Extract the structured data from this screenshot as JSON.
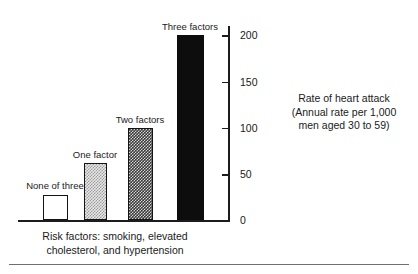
{
  "chart_data": {
    "type": "bar",
    "title": "",
    "categories": [
      "None of three",
      "One factor",
      "Two factors",
      "Three factors"
    ],
    "values": [
      28,
      62,
      100,
      200
    ],
    "series": [
      {
        "name": "Rate of heart attack",
        "values": [
          28,
          62,
          100,
          200
        ]
      }
    ],
    "bar_styles": [
      "open",
      "light-checker",
      "dark-checker",
      "solid-black"
    ],
    "xlabel": "Risk factors: smoking, elevated cholesterol, and hypertension",
    "ylabel": "Rate of heart attack (Annual rate per 1,000 men aged 30 to 59)",
    "ylim": [
      0,
      210
    ],
    "yticks": [
      0,
      50,
      100,
      150,
      200
    ],
    "ytick_labels": [
      "0",
      "50",
      "100",
      "150",
      "200"
    ],
    "y_axis_position": "right",
    "grid": false,
    "legend": "none"
  },
  "axis": {
    "ticks": [
      {
        "value": 200,
        "label": "200"
      },
      {
        "value": 150,
        "label": "150"
      },
      {
        "value": 100,
        "label": "100"
      },
      {
        "value": 50,
        "label": "50"
      },
      {
        "value": 0,
        "label": "0"
      }
    ]
  },
  "bars": [
    {
      "label": "None of three",
      "value": 28
    },
    {
      "label": "One factor",
      "value": 62
    },
    {
      "label": "Two factors",
      "value": 100
    },
    {
      "label": "Three factors",
      "value": 200
    }
  ],
  "axis_caption": {
    "line1": "Rate of heart attack",
    "line2": "(Annual rate per 1,000",
    "line3": "men aged 30 to 59)"
  },
  "x_caption": {
    "line1": "Risk factors: smoking, elevated",
    "line2": "cholesterol, and hypertension"
  },
  "colors": {
    "ink": "#1a1a1a",
    "axis": "#1c1c1c",
    "bar_solid": "#0d0d0d",
    "bar_light": "#e8e8e8",
    "bar_dark": "#3a3a3a",
    "bar_open": "#ffffff",
    "rule": "#6e6e6e"
  }
}
